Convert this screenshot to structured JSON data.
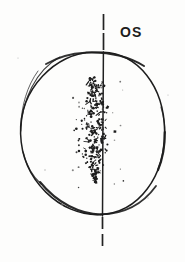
{
  "figure": {
    "kind": "visual-field-chart",
    "eye_label": "OS",
    "background_color": "#fdfdfc",
    "ink_color": "#1d1d1d"
  },
  "chart_data": {
    "type": "scatter",
    "title": "OS",
    "xlabel": "",
    "ylabel": "",
    "xlim": [
      -1,
      1
    ],
    "ylim": [
      -1,
      1
    ],
    "grid": false,
    "legend": null,
    "annotations": [
      {
        "text": "OS",
        "x_px": 122,
        "y_px": 28,
        "role": "eye-designation-left-eye"
      }
    ],
    "shapes": [
      {
        "name": "field-boundary-circle",
        "type": "circle",
        "cx_px": 92.5,
        "cy_px": 133.5,
        "rx_px": 72.5,
        "ry_px": 81.5,
        "stroke": "#1d1d1d",
        "fill": "none"
      },
      {
        "name": "vertical-meridian-line",
        "type": "line",
        "x_px": 103,
        "y_top_px": 14,
        "y_bottom_px": 246,
        "stroke": "#1d1d1d",
        "dashed_outside_circle": true,
        "solid_inside_circle": true
      }
    ],
    "series": [
      {
        "name": "scotoma-stipple-cloud",
        "marker": "dot",
        "color": "#1d1d1d",
        "bounds_px": {
          "x_min": 70,
          "x_max": 120,
          "y_min": 78,
          "y_max": 182
        },
        "centroid_px": {
          "x": 97,
          "y": 127
        },
        "point_count": 300,
        "description": "dense vertically-elongated stippled region straddling the vertical meridian"
      }
    ]
  }
}
